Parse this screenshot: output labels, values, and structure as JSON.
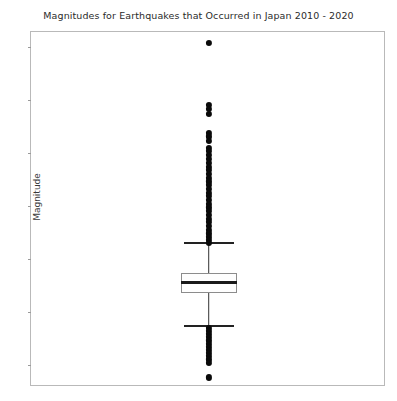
{
  "figure": {
    "title": "Magnitudes for Earthquakes that Occurred in Japan 2010 - 2020",
    "ylabel": "Magnitude"
  },
  "chart_data": {
    "type": "box",
    "title": "Magnitudes for Earthquakes that Occurred in Japan 2010 - 2020",
    "xlabel": "",
    "ylabel": "Magnitude",
    "ylim": [
      2.6,
      9.3
    ],
    "yticks": [
      3,
      4,
      5,
      6,
      7,
      8,
      9
    ],
    "ytick_labels": [
      "3",
      "4",
      "5",
      "6",
      "7",
      "8",
      "9"
    ],
    "xticks": [],
    "xtick_labels": [],
    "grid": false,
    "legend": false,
    "categories": [
      "Japan 2010 - 2020"
    ],
    "boxes": [
      {
        "label": "Japan 2010 - 2020",
        "whisker_low": 3.75,
        "q1": 4.37,
        "median": 4.58,
        "q3": 4.76,
        "whisker_high": 5.31,
        "fliers_high": [
          9.09,
          7.93,
          7.85,
          7.76,
          7.4,
          7.33,
          7.24,
          7.12,
          7.05,
          6.98,
          6.9,
          6.83,
          6.76,
          6.69,
          6.62,
          6.55,
          6.48,
          6.41,
          6.34,
          6.27,
          6.2,
          6.13,
          6.06,
          5.99,
          5.92,
          5.85,
          5.78,
          5.71,
          5.64,
          5.57,
          5.5,
          5.44,
          5.38,
          5.32
        ],
        "fliers_low": [
          3.72,
          3.66,
          3.6,
          3.54,
          3.48,
          3.42,
          3.36,
          3.3,
          3.24,
          3.18,
          3.12,
          3.06,
          2.78
        ]
      }
    ],
    "box_center_x": 0.5,
    "box_width_px": 56,
    "cap_width_px": 50,
    "colors": {
      "box_edge": "#8c8c8c",
      "median": "#1a1a1a",
      "whisker": "#333333",
      "flier": "#0a0a0a",
      "axes_frame": "#b9b9b9",
      "text": "#3a3a3a",
      "background": "#ffffff"
    }
  }
}
